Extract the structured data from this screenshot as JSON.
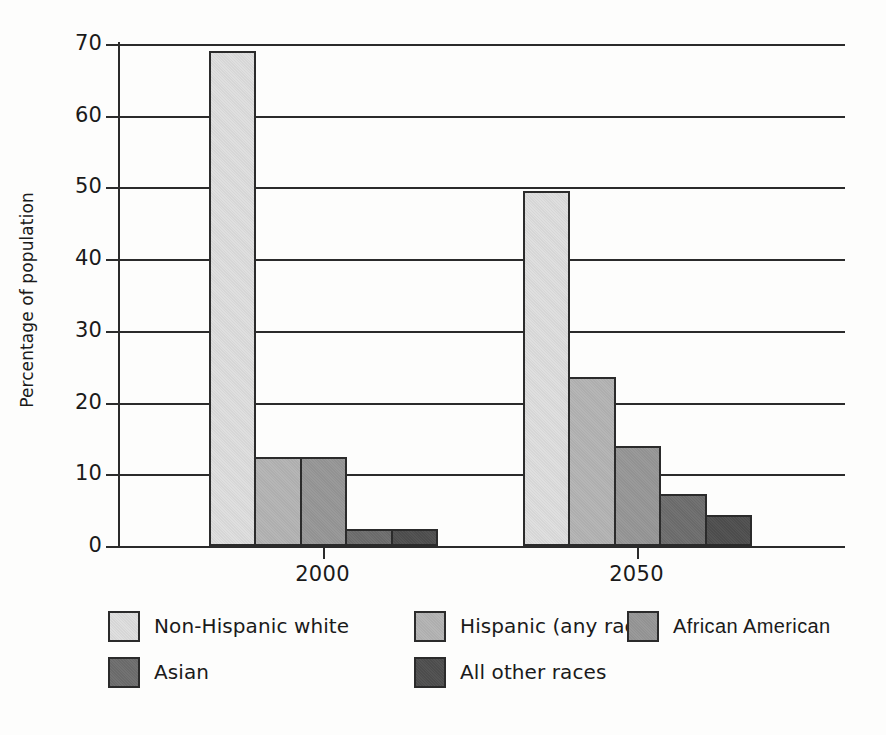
{
  "chart_data": {
    "type": "bar",
    "title": "",
    "subtitle": "",
    "xlabel": "",
    "ylabel": "Percentage of population",
    "ylim": [
      0,
      70
    ],
    "yticks": [
      0,
      10,
      20,
      30,
      40,
      50,
      60,
      70
    ],
    "ytick_labels": [
      "0",
      "10",
      "20",
      "30",
      "40",
      "50",
      "60",
      "70"
    ],
    "grid": true,
    "legend_position": "bottom",
    "categories": [
      "2000",
      "2050"
    ],
    "series": [
      {
        "name": "Non-Hispanic white",
        "color": "#dedede",
        "values": [
          69.0,
          49.5
        ]
      },
      {
        "name": "Hispanic (any race)",
        "color": "#b4b4b4",
        "values": [
          12.4,
          23.6
        ]
      },
      {
        "name": "African  American",
        "color": "#979797",
        "values": [
          12.4,
          13.9
        ]
      },
      {
        "name": "Asian",
        "color": "#6e6e6e",
        "values": [
          2.4,
          7.2
        ]
      },
      {
        "name": "All other races",
        "color": "#4f4f4f",
        "values": [
          2.4,
          4.3
        ]
      }
    ]
  },
  "axis": {
    "y_title": "Percentage of population",
    "y_tick_labels": [
      "70",
      "60",
      "50",
      "40",
      "30",
      "20",
      "10",
      "0"
    ],
    "x_tick_labels": [
      "2000",
      "2050"
    ]
  },
  "legend": {
    "items": [
      {
        "label": "Non-Hispanic white",
        "color": "#dedede"
      },
      {
        "label": "Hispanic (any race)",
        "color": "#b4b4b4"
      },
      {
        "label": "African  American",
        "color": "#979797"
      },
      {
        "label": "Asian",
        "color": "#6e6e6e"
      },
      {
        "label": "All other races",
        "color": "#4f4f4f"
      }
    ]
  },
  "colors": {
    "axis": "#2b2b2b",
    "background": "#fdfdfc",
    "text": "#1a1a1a"
  }
}
